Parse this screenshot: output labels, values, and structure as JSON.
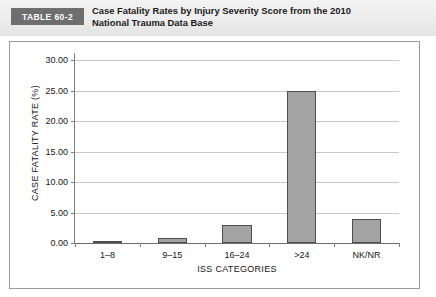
{
  "header": {
    "badge_label": "TABLE 60-2",
    "title_line1": "Case Fatality Rates by Injury Severity Score from the 2010",
    "title_line2": "National Trauma Data Base",
    "badge_color": "#6e6e6e",
    "band_color": "#ededed"
  },
  "chart_data": {
    "type": "bar",
    "title": "",
    "subtitle": "",
    "xlabel": "ISS CATEGORIES",
    "ylabel": "CASE FATALITY RATE (%)",
    "categories": [
      "1–8",
      "9–15",
      "16–24",
      ">24",
      "NK/NR"
    ],
    "values": [
      0.2,
      0.9,
      3.0,
      25.0,
      4.0
    ],
    "ylim": [
      0,
      30
    ],
    "ytick_values": [
      0,
      5,
      10,
      15,
      20,
      25,
      30
    ],
    "ytick_labels": [
      "0.00",
      "5.00",
      "10.00",
      "15.00",
      "20.00",
      "25.00",
      "30.00"
    ],
    "grid": true,
    "legend": false,
    "legend_position": "none",
    "bar_fill_color": "#a3a3a3",
    "bar_border_color": "#4d4d4d",
    "gridline_color": "#c9c9c9",
    "axis_color": "#7d7d7d"
  }
}
